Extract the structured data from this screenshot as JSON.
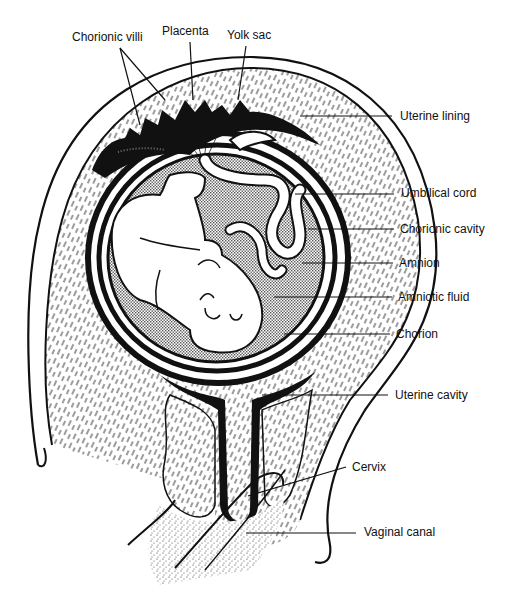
{
  "diagram": {
    "colors": {
      "ink": "#111111",
      "background": "#ffffff",
      "stipple": "#9a9a9a"
    },
    "labels": [
      {
        "id": "chorionic-villi",
        "text": "Chorionic villi",
        "x": 72,
        "y": 30
      },
      {
        "id": "placenta",
        "text": "Placenta",
        "x": 162,
        "y": 24
      },
      {
        "id": "yolk-sac",
        "text": "Yolk sac",
        "x": 227,
        "y": 28
      },
      {
        "id": "uterine-lining",
        "text": "Uterine lining",
        "x": 400,
        "y": 109
      },
      {
        "id": "umbilical-cord",
        "text": "Umbilical cord",
        "x": 401,
        "y": 186
      },
      {
        "id": "chorionic-cavity",
        "text": "Chorionic cavity",
        "x": 400,
        "y": 222
      },
      {
        "id": "amnion",
        "text": "Amnion",
        "x": 399,
        "y": 256
      },
      {
        "id": "amniotic-fluid",
        "text": "Amniotic fluid",
        "x": 398,
        "y": 290
      },
      {
        "id": "chorion",
        "text": "Chorion",
        "x": 396,
        "y": 327
      },
      {
        "id": "uterine-cavity",
        "text": "Uterine cavity",
        "x": 395,
        "y": 388
      },
      {
        "id": "cervix",
        "text": "Cervix",
        "x": 352,
        "y": 460
      },
      {
        "id": "vaginal-canal",
        "text": "Vaginal canal",
        "x": 364,
        "y": 525
      }
    ]
  }
}
